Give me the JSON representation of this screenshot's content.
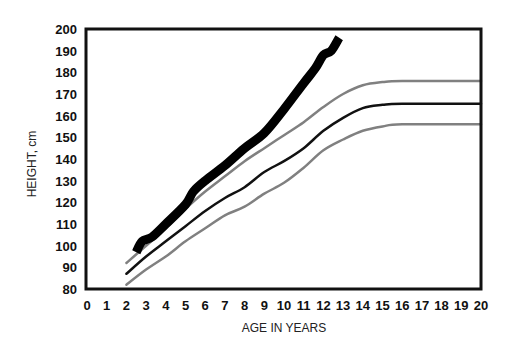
{
  "chart_data": {
    "type": "line",
    "title": "",
    "xlabel": "AGE IN YEARS",
    "ylabel": "HEIGHT, cm",
    "xlim": [
      0,
      20
    ],
    "ylim": [
      80,
      200
    ],
    "x_ticks": [
      0,
      1,
      2,
      3,
      4,
      5,
      6,
      7,
      8,
      9,
      10,
      11,
      12,
      13,
      14,
      15,
      16,
      17,
      18,
      19,
      20
    ],
    "y_ticks": [
      80,
      90,
      100,
      110,
      120,
      130,
      140,
      150,
      160,
      170,
      180,
      190,
      200
    ],
    "grid": false,
    "legend": null,
    "series": [
      {
        "name": "upper reference (grey)",
        "color": "#808080",
        "width": 2.5,
        "points": [
          [
            2,
            92
          ],
          [
            3,
            100
          ],
          [
            4,
            108
          ],
          [
            5,
            117
          ],
          [
            6,
            125
          ],
          [
            7,
            132
          ],
          [
            8,
            139
          ],
          [
            9,
            145
          ],
          [
            10,
            151
          ],
          [
            11,
            157
          ],
          [
            12,
            164
          ],
          [
            13,
            170
          ],
          [
            14,
            174
          ],
          [
            15,
            175.5
          ],
          [
            16,
            176
          ],
          [
            20,
            176
          ]
        ]
      },
      {
        "name": "median (black)",
        "color": "#111111",
        "width": 2.5,
        "points": [
          [
            2,
            87
          ],
          [
            3,
            95
          ],
          [
            4,
            102
          ],
          [
            5,
            109
          ],
          [
            6,
            116
          ],
          [
            7,
            122
          ],
          [
            8,
            127
          ],
          [
            9,
            134
          ],
          [
            10,
            139
          ],
          [
            11,
            145
          ],
          [
            12,
            153
          ],
          [
            13,
            159
          ],
          [
            14,
            163.5
          ],
          [
            15,
            165
          ],
          [
            16,
            165.5
          ],
          [
            20,
            165.5
          ]
        ]
      },
      {
        "name": "lower reference (grey)",
        "color": "#808080",
        "width": 2.5,
        "points": [
          [
            2,
            82
          ],
          [
            3,
            89
          ],
          [
            4,
            95
          ],
          [
            5,
            102
          ],
          [
            6,
            108
          ],
          [
            7,
            114
          ],
          [
            8,
            118
          ],
          [
            9,
            124
          ],
          [
            10,
            129
          ],
          [
            11,
            136
          ],
          [
            12,
            144
          ],
          [
            13,
            149
          ],
          [
            14,
            153
          ],
          [
            15,
            155
          ],
          [
            16,
            156
          ],
          [
            20,
            156
          ]
        ]
      },
      {
        "name": "patient height (thick black)",
        "color": "#000000",
        "width": 9,
        "points": [
          [
            2.5,
            97
          ],
          [
            2.8,
            102
          ],
          [
            3.3,
            104
          ],
          [
            4,
            110
          ],
          [
            5,
            119
          ],
          [
            5.4,
            125
          ],
          [
            6,
            130
          ],
          [
            7,
            137
          ],
          [
            8,
            145
          ],
          [
            9,
            152
          ],
          [
            10,
            163
          ],
          [
            11,
            175
          ],
          [
            11.6,
            182
          ],
          [
            12,
            188
          ],
          [
            12.4,
            190
          ],
          [
            12.8,
            196
          ]
        ]
      }
    ]
  },
  "axes": {
    "x_label": "AGE IN YEARS",
    "y_label": "HEIGHT, cm"
  }
}
